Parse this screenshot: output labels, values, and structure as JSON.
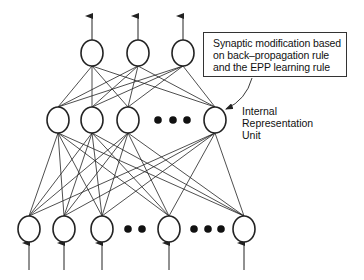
{
  "diagram": {
    "type": "neural-network",
    "colors": {
      "stroke": "#222222",
      "background": "#ffffff",
      "text": "#111111"
    },
    "layers": {
      "output": {
        "nodes": [
          {
            "x": 92,
            "y": 53
          },
          {
            "x": 138,
            "y": 53
          },
          {
            "x": 183,
            "y": 53
          }
        ],
        "ellipsis": []
      },
      "hidden": {
        "nodes": [
          {
            "x": 58,
            "y": 120
          },
          {
            "x": 92,
            "y": 120
          },
          {
            "x": 128,
            "y": 120
          },
          {
            "x": 215,
            "y": 120
          }
        ],
        "ellipsis": [
          {
            "x": 158,
            "y": 120
          },
          {
            "x": 173,
            "y": 120
          },
          {
            "x": 187,
            "y": 120
          }
        ]
      },
      "input": {
        "nodes": [
          {
            "x": 29,
            "y": 229
          },
          {
            "x": 64,
            "y": 229
          },
          {
            "x": 102,
            "y": 229
          },
          {
            "x": 169,
            "y": 229
          },
          {
            "x": 244,
            "y": 229
          }
        ],
        "ellipsis": [
          {
            "x": 128,
            "y": 229
          },
          {
            "x": 142,
            "y": 229
          },
          {
            "x": 194,
            "y": 229
          },
          {
            "x": 208,
            "y": 229
          },
          {
            "x": 221,
            "y": 229
          }
        ]
      }
    },
    "annotation": {
      "lines": [
        "Synaptic modification based",
        "on back–propagation rule",
        "and the EPP learning rule"
      ]
    },
    "unit_label": {
      "lines": [
        "Internal",
        "Representation",
        "Unit"
      ]
    }
  }
}
